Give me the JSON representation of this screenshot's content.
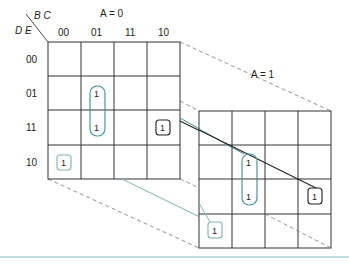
{
  "diagram": {
    "type": "karnaugh-map-5-variable",
    "row_var_label": "D E",
    "col_var_label": "B C",
    "maps": [
      {
        "title": "A = 0",
        "col_headers": [
          "00",
          "01",
          "11",
          "10"
        ],
        "row_headers": [
          "00",
          "01",
          "11",
          "10"
        ],
        "cells": [
          [
            "",
            "",
            "",
            ""
          ],
          [
            "",
            "1",
            "",
            ""
          ],
          [
            "",
            "1",
            "",
            "1"
          ],
          [
            "1",
            "",
            "",
            ""
          ]
        ]
      },
      {
        "title": "A = 1",
        "cells": [
          [
            "",
            "",
            "",
            ""
          ],
          [
            "",
            "1",
            "",
            ""
          ],
          [
            "",
            "1",
            "",
            "1"
          ],
          [
            "1",
            "",
            "",
            ""
          ]
        ]
      }
    ],
    "groups": [
      {
        "name": "pair-B'CE",
        "color": "#3a8f96",
        "cells": "rows 01-11, col 01, both maps"
      },
      {
        "name": "single-BC'DE",
        "color": "#222222",
        "cells": "row 11, col 10, both maps"
      },
      {
        "name": "single-B'C'DE'",
        "color": "#7fb3b5",
        "cells": "row 10, col 00, both maps"
      }
    ],
    "colors": {
      "grid": "#333333",
      "teal": "#3a8f96",
      "light_teal": "#7fb3b5",
      "rule": "#7fbfc6"
    }
  }
}
